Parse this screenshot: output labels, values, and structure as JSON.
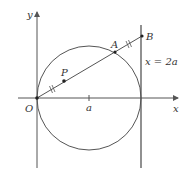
{
  "diagram": {
    "labels": {
      "y_axis": "y",
      "x_axis": "x",
      "origin": "O",
      "point_p": "P",
      "point_a": "A",
      "point_b": "B",
      "center_tick": "a",
      "vertical_line": "x = 2a"
    },
    "colors": {
      "stroke": "#555555",
      "text": "#333333"
    }
  }
}
